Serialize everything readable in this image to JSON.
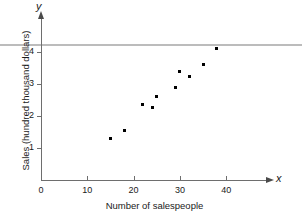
{
  "chart_data": {
    "type": "scatter",
    "title": "",
    "xlabel": "Number of salespeople",
    "ylabel": "Sales (hundred thousand dollars)",
    "x_axis_variable": "x",
    "y_axis_variable": "y",
    "xlim": [
      0,
      49
    ],
    "ylim": [
      0,
      4.9
    ],
    "xticks": [
      0,
      10,
      20,
      30,
      40
    ],
    "xtick_labels": [
      "0",
      "10",
      "20",
      "30",
      "40"
    ],
    "yticks": [
      1,
      2,
      3,
      4
    ],
    "ytick_labels": [
      "1",
      "2",
      "3",
      "4"
    ],
    "grid": false,
    "legend": "none",
    "marker": "square",
    "marker_color": "#000000",
    "axis_color": "#6e6e6e",
    "rule_color": "#bcbcbc",
    "points": [
      {
        "x": 15,
        "y": 1.3
      },
      {
        "x": 18,
        "y": 1.55
      },
      {
        "x": 22,
        "y": 2.35
      },
      {
        "x": 24,
        "y": 2.28
      },
      {
        "x": 25,
        "y": 2.6
      },
      {
        "x": 29,
        "y": 2.9
      },
      {
        "x": 30,
        "y": 3.38
      },
      {
        "x": 32,
        "y": 3.23
      },
      {
        "x": 35,
        "y": 3.6
      },
      {
        "x": 38,
        "y": 4.1
      }
    ]
  }
}
